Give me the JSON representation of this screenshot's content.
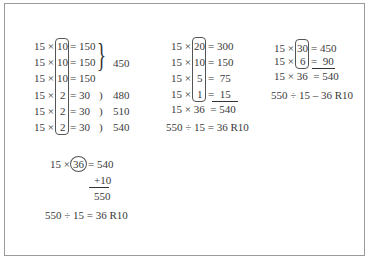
{
  "left_block": {
    "rows": [
      {
        "a": "15 ×",
        "b": "10",
        "eq": "= 150"
      },
      {
        "a": "15 ×",
        "b": "10",
        "eq": "= 150"
      },
      {
        "a": "15 ×",
        "b": "10",
        "eq": "= 150"
      },
      {
        "a": "15 ×",
        "b": "2",
        "eq": "= 30"
      },
      {
        "a": "15 ×",
        "b": "2",
        "eq": "= 30"
      },
      {
        "a": "15 ×",
        "b": "2",
        "eq": "= 30"
      }
    ],
    "totals": [
      "450",
      "480",
      "510",
      "540"
    ],
    "paren": ")"
  },
  "middle_block": {
    "rows": [
      {
        "a": "15 ×",
        "b": "20",
        "eq": "= 300"
      },
      {
        "a": "15 ×",
        "b": "10",
        "eq": "= 150"
      },
      {
        "a": "15 ×",
        "b": "5",
        "eq": "=  75"
      },
      {
        "a": "15 ×",
        "b": "1",
        "eq": "=  15"
      }
    ],
    "sum_row": "15 × 36  = 540",
    "result": "550 ÷ 15 = 36 R10"
  },
  "right_block": {
    "rows": [
      {
        "a": "15 ×",
        "b": "30",
        "eq": "= 450"
      },
      {
        "a": "15 ×",
        "b": "6",
        "eq": "=  90"
      }
    ],
    "sum_row": "15 × 36  = 540",
    "result": "550 ÷ 15 – 36 R10"
  },
  "bottom_block": {
    "a": "15 ×",
    "b": "36",
    "eq": "= 540",
    "add": "+10",
    "sum": "550",
    "result": "550 ÷ 15 = 36 R10"
  }
}
